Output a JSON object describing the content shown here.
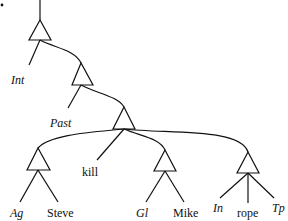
{
  "diagram": {
    "type": "syntax-tree",
    "line_color": "#111111",
    "background": "#ffffff",
    "nodes": [
      {
        "id": "n0",
        "kind": "triangle",
        "apex": [
          40,
          20
        ]
      },
      {
        "id": "n1",
        "kind": "triangle",
        "apex": [
          81,
          63
        ]
      },
      {
        "id": "n2",
        "kind": "triangle",
        "apex": [
          124,
          107
        ]
      },
      {
        "id": "n3",
        "kind": "triangle",
        "apex": [
          38,
          148
        ]
      },
      {
        "id": "n4",
        "kind": "triangle",
        "apex": [
          165,
          150
        ]
      },
      {
        "id": "n5",
        "kind": "triangle",
        "apex": [
          248,
          152
        ]
      }
    ],
    "labels": {
      "int": "Int",
      "past": "Past",
      "kill": "kill",
      "ag": "Ag",
      "steve": "Steve",
      "gl": "Gl",
      "mike": "Mike",
      "in": "In",
      "rope": "rope",
      "tp": "Tp"
    }
  }
}
